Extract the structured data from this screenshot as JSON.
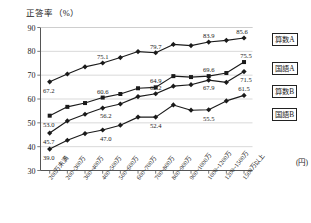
{
  "chart_data": {
    "type": "line",
    "title": "",
    "ylabel": "正答率（%）",
    "xlabel": "(円)",
    "ylim": [
      30,
      90
    ],
    "yticks": [
      30,
      40,
      50,
      60,
      70,
      80,
      90
    ],
    "grid": true,
    "legend_position": "right",
    "categories": [
      "200万未満",
      "200~300万",
      "300~400万",
      "400~500万",
      "500~600万",
      "600~700万",
      "700~800万",
      "800~900万",
      "900~1000万",
      "1000~1200万",
      "1200~1500万",
      "1500万以上"
    ],
    "series": [
      {
        "name": "算数A",
        "marker": "diamond",
        "values": [
          67.2,
          70.5,
          73.5,
          75.1,
          77.4,
          79.9,
          79.4,
          82.9,
          82.4,
          83.9,
          84.6,
          85.6
        ],
        "labels": {
          "0": "67.2",
          "3": "75.1",
          "6": "79.7",
          "9": "83.9",
          "11": "85.6"
        }
      },
      {
        "name": "国語A",
        "marker": "square",
        "values": [
          53.0,
          56.7,
          58.3,
          60.6,
          62.1,
          64.5,
          64.9,
          69.6,
          69.2,
          69.6,
          70.9,
          75.5
        ],
        "labels": {
          "0": "53.0",
          "3": "60.6",
          "6": "64.9",
          "9": "69.6",
          "11": "75.5"
        }
      },
      {
        "name": "算数B",
        "marker": "diamond",
        "values": [
          45.7,
          50.8,
          53.6,
          56.2,
          57.9,
          61.0,
          62.2,
          65.4,
          66.0,
          67.9,
          67.0,
          71.5
        ],
        "labels": {
          "0": "45.7",
          "3": "56.2",
          "6": "62.2",
          "9": "67.9",
          "11": "71.5"
        }
      },
      {
        "name": "国語B",
        "marker": "diamond",
        "values": [
          39.0,
          42.7,
          45.5,
          47.0,
          49.0,
          52.4,
          52.4,
          57.5,
          55.3,
          55.5,
          59.2,
          61.5
        ],
        "labels": {
          "0": "39.0",
          "3": "47.0",
          "6": "52.4",
          "9": "55.5",
          "11": "61.5"
        }
      }
    ]
  },
  "legend": {
    "items": [
      {
        "label": "算数A"
      },
      {
        "label": "国語A"
      },
      {
        "label": "算数B"
      },
      {
        "label": "国語B"
      }
    ]
  },
  "colors": {
    "line": "#1a1a1a",
    "grid": "#c9c9c9",
    "axis": "#555555",
    "label_text": "#222222",
    "background": "#ffffff"
  }
}
